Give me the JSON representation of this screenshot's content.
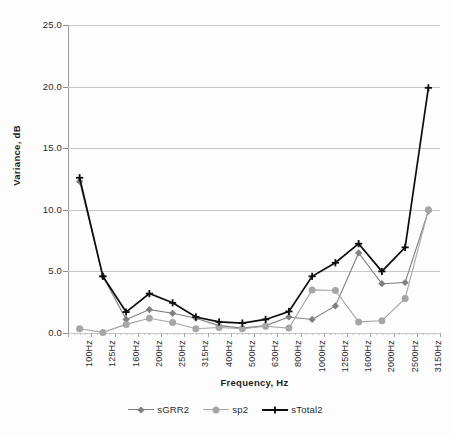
{
  "chart_data": {
    "type": "line",
    "title": "",
    "xlabel": "Frequency, Hz",
    "ylabel": "Variance, dB",
    "categories": [
      "100Hz",
      "125Hz",
      "160Hz",
      "200Hz",
      "250Hz",
      "315Hz",
      "400Hz",
      "500Hz",
      "630Hz",
      "800Hz",
      "1000Hz",
      "1250Hz",
      "1600Hz",
      "2000Hz",
      "2500Hz",
      "3150Hz"
    ],
    "ylim": [
      0.0,
      25.0
    ],
    "yticks": [
      0.0,
      5.0,
      10.0,
      15.0,
      20.0,
      25.0
    ],
    "ytick_labels": [
      "0.0",
      "5.0",
      "10.0",
      "15.0",
      "20.0",
      "25.0"
    ],
    "grid": true,
    "legend_position": "bottom",
    "series": [
      {
        "name": "sGRR2",
        "color": "#808080",
        "marker": "diamond",
        "values": [
          12.3,
          4.6,
          1.1,
          1.9,
          1.6,
          1.2,
          0.6,
          0.4,
          0.6,
          1.3,
          1.1,
          2.2,
          6.5,
          4.0,
          4.1,
          9.9
        ]
      },
      {
        "name": "sp2",
        "color": "#a6a6a6",
        "marker": "circle",
        "values": [
          0.35,
          0.05,
          0.7,
          1.2,
          0.85,
          0.35,
          0.45,
          0.35,
          0.55,
          0.4,
          3.5,
          3.45,
          0.9,
          1.0,
          2.8,
          10.0
        ]
      },
      {
        "name": "sTotal2",
        "color": "#0d0d0d",
        "marker": "plus",
        "values": [
          12.6,
          4.6,
          1.7,
          3.2,
          2.45,
          1.3,
          0.9,
          0.8,
          1.1,
          1.75,
          4.6,
          5.7,
          7.25,
          5.0,
          6.95,
          19.9
        ]
      }
    ]
  },
  "axis": {
    "y_title": "Variance, dB",
    "x_title": "Frequency, Hz"
  },
  "legend": {
    "entries": [
      {
        "label": "sGRR2"
      },
      {
        "label": "sp2"
      },
      {
        "label": "sTotal2"
      }
    ]
  }
}
